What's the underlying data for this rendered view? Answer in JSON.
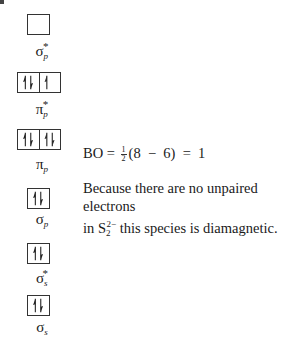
{
  "diagram": {
    "orbitals": [
      {
        "id": "sigma_p_star",
        "symbol": "σ",
        "subscript": "p",
        "superscript": "*",
        "boxes": [
          "empty"
        ]
      },
      {
        "id": "pi_p_star",
        "symbol": "π",
        "subscript": "p",
        "superscript": "*",
        "boxes": [
          "paired",
          "up"
        ]
      },
      {
        "id": "pi_p",
        "symbol": "π",
        "subscript": "p",
        "superscript": "",
        "boxes": [
          "paired",
          "paired"
        ]
      },
      {
        "id": "sigma_p",
        "symbol": "σ",
        "subscript": "p",
        "superscript": "",
        "boxes": [
          "paired"
        ]
      },
      {
        "id": "sigma_s_star",
        "symbol": "σ",
        "subscript": "s",
        "superscript": "*",
        "boxes": [
          "paired"
        ]
      },
      {
        "id": "sigma_s",
        "symbol": "σ",
        "subscript": "s",
        "superscript": "",
        "boxes": [
          "paired"
        ]
      }
    ]
  },
  "bond_order": {
    "prefix": "BO =",
    "frac_num": "1",
    "frac_den": "2",
    "expression": "(8  −  6)  =  1"
  },
  "explanation": {
    "line1": "Because there are no unpaired electrons",
    "line2_pre": "in S",
    "species_sub": "2",
    "species_sup": "2−",
    "line2_post": " this species is diamagnetic."
  }
}
